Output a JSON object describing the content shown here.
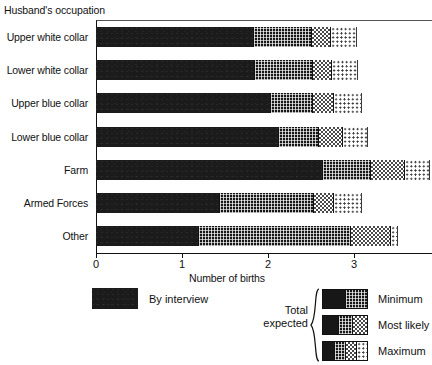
{
  "chart_data": {
    "type": "bar",
    "orientation": "horizontal",
    "stacked": false,
    "title": "",
    "group_title": "Husband's occupation",
    "xlabel": "Number of births",
    "ylabel": "",
    "xlim": [
      0,
      3.907
    ],
    "xticks": [
      0,
      1,
      2,
      3
    ],
    "xtick_labels": [
      "0",
      "1",
      "2",
      "3"
    ],
    "grid": false,
    "categories": [
      "Upper white collar",
      "Lower white collar",
      "Upper blue collar",
      "Lower blue collar",
      "Farm",
      "Armed Forces",
      "Other"
    ],
    "series": [
      {
        "name": "By interview",
        "pattern": "solid-black",
        "values": [
          1.83,
          1.84,
          2.02,
          2.12,
          2.63,
          1.43,
          1.19
        ]
      },
      {
        "name": "Minimum",
        "pattern": "dense-dark-grid",
        "values": [
          2.5,
          2.51,
          2.51,
          2.58,
          3.19,
          2.52,
          2.95
        ]
      },
      {
        "name": "Most likely",
        "pattern": "mid-checker",
        "values": [
          2.72,
          2.73,
          2.76,
          2.86,
          3.58,
          2.76,
          3.42
        ]
      },
      {
        "name": "Maximum",
        "pattern": "light-dots",
        "values": [
          3.04,
          3.05,
          3.09,
          3.16,
          3.88,
          3.09,
          3.51
        ]
      }
    ],
    "legend": {
      "position": "below-plot",
      "interview_label": "By interview",
      "total_expected_label": "Total\nexpected",
      "total_expected_line1": "Total",
      "total_expected_line2": "expected",
      "entries": [
        "Minimum",
        "Most likely",
        "Maximum"
      ]
    },
    "colors": {
      "interview": "#1b1b1b",
      "minimum": "#171717",
      "most_likely": "#4a4a4a",
      "maximum": "#3d3d3d",
      "axis": "#111111",
      "background": "#ffffff"
    }
  }
}
